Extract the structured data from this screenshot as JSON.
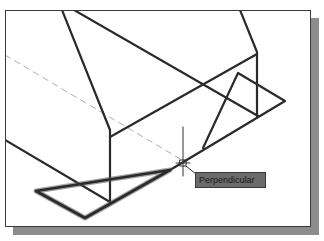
{
  "drawing": {
    "snap_tooltip": "Perpendicular",
    "colors": {
      "line": "#2a2a2a",
      "dashed": "#b0b0b0",
      "tooltip_bg": "#6b6b6b",
      "shadow": "#8c8c8c"
    },
    "cursor": {
      "x": 183,
      "y": 163
    }
  }
}
